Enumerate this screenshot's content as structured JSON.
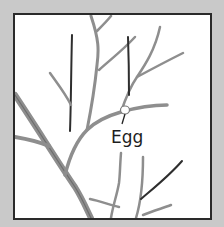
{
  "diagram": {
    "label": "Egg",
    "colors": {
      "background": "#c9c9c9",
      "panel": "#ffffff",
      "border": "#2a2a2a",
      "branch": "#8e8e8e",
      "branch_dark": "#3a3a3a",
      "text": "#1e1e1e"
    }
  }
}
